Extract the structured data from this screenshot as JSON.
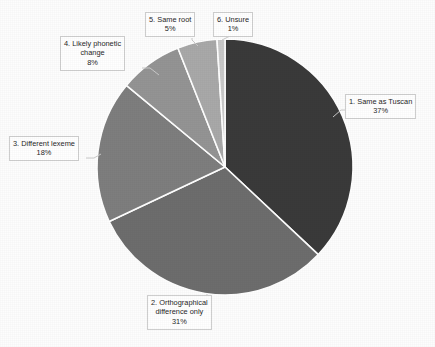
{
  "chart_data": {
    "type": "pie",
    "title": "",
    "subtitle": "",
    "xlabel": "",
    "ylabel": "",
    "legend_position": "none",
    "grid": false,
    "start_angle_deg": 0,
    "direction": "clockwise",
    "categories": [
      "1. Same as Tuscan",
      "2. Orthographical difference only",
      "3. Different lexeme",
      "4. Likely phonetic change",
      "5. Same root",
      "6. Unsure"
    ],
    "values": [
      37,
      31,
      18,
      8,
      5,
      1
    ],
    "value_unit": "%",
    "colors": [
      "#3a3a3a",
      "#6d6d6d",
      "#7e7e7e",
      "#949494",
      "#a9a9a9",
      "#c9c9c9"
    ],
    "separator_color": "#ffffff",
    "slices": [
      {
        "index": 1,
        "label": "1. Same as Tuscan",
        "label_line1": "1. Same as Tuscan",
        "value_text": "37%",
        "value": 37,
        "color": "#3a3a3a"
      },
      {
        "index": 2,
        "label": "2. Orthographical difference only",
        "label_line1": "2. Orthographical",
        "label_line2": "difference only",
        "value_text": "31%",
        "value": 31,
        "color": "#6d6d6d"
      },
      {
        "index": 3,
        "label": "3. Different lexeme",
        "label_line1": "3. Different lexeme",
        "value_text": "18%",
        "value": 18,
        "color": "#7e7e7e"
      },
      {
        "index": 4,
        "label": "4. Likely phonetic change",
        "label_line1": "4. Likely phonetic",
        "label_line2": "change",
        "value_text": "8%",
        "value": 8,
        "color": "#949494"
      },
      {
        "index": 5,
        "label": "5. Same root",
        "label_line1": "5. Same root",
        "value_text": "5%",
        "value": 5,
        "color": "#a9a9a9"
      },
      {
        "index": 6,
        "label": "6. Unsure",
        "label_line1": "6. Unsure",
        "value_text": "1%",
        "value": 1,
        "color": "#c9c9c9"
      }
    ]
  },
  "geometry": {
    "center_x": 225,
    "center_y": 167,
    "radius": 128
  }
}
